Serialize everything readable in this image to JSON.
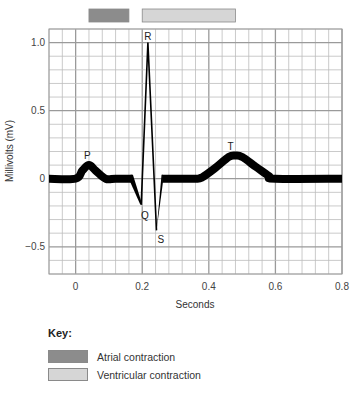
{
  "chart_data": {
    "type": "line",
    "title": "",
    "xlabel": "Seconds",
    "ylabel": "Millivolts (mV)",
    "xlim": [
      -0.08,
      0.8
    ],
    "ylim": [
      -0.7,
      1.1
    ],
    "grid": true,
    "x_major_ticks": [
      0,
      0.2,
      0.4,
      0.6,
      0.8
    ],
    "x_tick_labels": [
      "0",
      "0.2",
      "0.4",
      "0.6",
      "0.8"
    ],
    "x_minor_step": 0.04,
    "y_major_ticks": [
      1.0,
      0.5,
      0,
      -0.5
    ],
    "y_tick_labels": [
      "1.0",
      "0.5",
      "0",
      "−0.5"
    ],
    "y_minor_step": 0.1,
    "thick_segments": [
      {
        "name": "baseline-and-p-wave",
        "x": [
          -0.08,
          0.0,
          0.02,
          0.04,
          0.06,
          0.09,
          0.12,
          0.17
        ],
        "y": [
          0,
          0,
          0.06,
          0.1,
          0.06,
          0,
          0,
          0
        ]
      },
      {
        "name": "st-and-t-wave",
        "x": [
          0.26,
          0.32,
          0.36,
          0.38,
          0.42,
          0.46,
          0.48,
          0.5,
          0.54,
          0.58,
          0.6,
          0.8
        ],
        "y": [
          0,
          0,
          0,
          0.01,
          0.08,
          0.16,
          0.17,
          0.16,
          0.09,
          0.02,
          0,
          0
        ]
      }
    ],
    "qrs_segment": {
      "x": [
        0.17,
        0.197,
        0.217,
        0.243,
        0.26
      ],
      "y": [
        0,
        -0.19,
        1.0,
        -0.38,
        0
      ]
    },
    "wave_labels": [
      {
        "text": "P",
        "x": 0.035,
        "y": 0.1
      },
      {
        "text": "Q",
        "x": 0.205,
        "y": -0.19
      },
      {
        "text": "R",
        "x": 0.217,
        "y": 1.0
      },
      {
        "text": "S",
        "x": 0.25,
        "y": -0.38
      },
      {
        "text": "T",
        "x": 0.465,
        "y": 0.17
      }
    ],
    "phase_bars": [
      {
        "name": "Atrial contraction",
        "start": 0.04,
        "end": 0.16,
        "color": "#8c8c8c"
      },
      {
        "name": "Ventricular contraction",
        "start": 0.2,
        "end": 0.48,
        "color": "#d6d6d6"
      }
    ],
    "legend": {
      "title": "Key:",
      "placement": "bottom-left",
      "entries": [
        {
          "label": "Atrial contraction",
          "color": "#8c8c8c"
        },
        {
          "label": "Ventricular contraction",
          "color": "#d6d6d6"
        }
      ]
    },
    "colors": {
      "grid_minor": "#bdbdbd",
      "grid_major": "#9a9a9a",
      "trace": "#000000"
    }
  }
}
